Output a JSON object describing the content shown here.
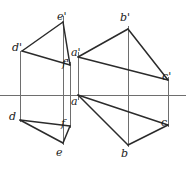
{
  "figure": {
    "background_color": "#ffffff",
    "line_color": "#2b2b2b",
    "thin_line_color": "#6e6e6e",
    "label_color": "#1b1b1b"
  },
  "ground_line": {
    "name": "x-axis",
    "y": 95,
    "x_start": 0,
    "x_end": 186
  },
  "labels": [
    {
      "id": "e-prime",
      "text": "e'",
      "x": 57,
      "y": 11
    },
    {
      "id": "b-prime",
      "text": "b'",
      "x": 120,
      "y": 12
    },
    {
      "id": "d-prime",
      "text": "d'",
      "x": 12,
      "y": 42
    },
    {
      "id": "a-prime",
      "text": "a'",
      "x": 71,
      "y": 47
    },
    {
      "id": "f-prime",
      "text": "f'",
      "x": 62,
      "y": 58
    },
    {
      "id": "c-prime",
      "text": "c'",
      "x": 162,
      "y": 71
    },
    {
      "id": "a",
      "text": "a",
      "x": 71,
      "y": 96
    },
    {
      "id": "d",
      "text": "d",
      "x": 9,
      "y": 111
    },
    {
      "id": "f",
      "text": "f",
      "x": 61,
      "y": 118
    },
    {
      "id": "c",
      "text": "c",
      "x": 161,
      "y": 117
    },
    {
      "id": "e",
      "text": "e",
      "x": 56,
      "y": 147
    },
    {
      "id": "b",
      "text": "b",
      "x": 121,
      "y": 148
    }
  ],
  "points": {
    "e_prime": {
      "x": 63,
      "y": 22
    },
    "d_prime": {
      "x": 22,
      "y": 51
    },
    "f_prime": {
      "x": 70,
      "y": 65
    },
    "a_prime": {
      "x": 78,
      "y": 57
    },
    "b_prime": {
      "x": 128,
      "y": 29
    },
    "c_prime": {
      "x": 168,
      "y": 80
    },
    "a": {
      "x": 78,
      "y": 95
    },
    "d": {
      "x": 20,
      "y": 120
    },
    "f": {
      "x": 70,
      "y": 126
    },
    "e": {
      "x": 63,
      "y": 143
    },
    "b": {
      "x": 128,
      "y": 145
    },
    "c": {
      "x": 168,
      "y": 125
    }
  },
  "edges": {
    "frontal_triangle_def": [
      {
        "from": "d_prime",
        "to": "e_prime"
      },
      {
        "from": "e_prime",
        "to": "f_prime"
      },
      {
        "from": "f_prime",
        "to": "d_prime"
      }
    ],
    "horizontal_triangle_def": [
      {
        "from": "d",
        "to": "e"
      },
      {
        "from": "e",
        "to": "f"
      },
      {
        "from": "f",
        "to": "d"
      }
    ],
    "frontal_triangle_abc": [
      {
        "from": "a_prime",
        "to": "b_prime"
      },
      {
        "from": "b_prime",
        "to": "c_prime"
      },
      {
        "from": "c_prime",
        "to": "a_prime"
      }
    ],
    "horizontal_triangle_abc": [
      {
        "from": "a",
        "to": "b"
      },
      {
        "from": "b",
        "to": "c"
      },
      {
        "from": "c",
        "to": "a"
      }
    ]
  },
  "projection_lines": [
    {
      "id": "proj-d",
      "x": 20,
      "y_top": 51,
      "y_bottom": 122
    },
    {
      "id": "proj-e",
      "x": 63,
      "y_top": 16,
      "y_bottom": 145
    },
    {
      "id": "proj-f",
      "x": 70,
      "y_top": 62,
      "y_bottom": 128
    },
    {
      "id": "proj-a",
      "x": 78,
      "y_top": 52,
      "y_bottom": 100
    },
    {
      "id": "proj-b",
      "x": 128,
      "y_top": 26,
      "y_bottom": 147
    },
    {
      "id": "proj-c",
      "x": 168,
      "y_top": 77,
      "y_bottom": 127
    }
  ]
}
